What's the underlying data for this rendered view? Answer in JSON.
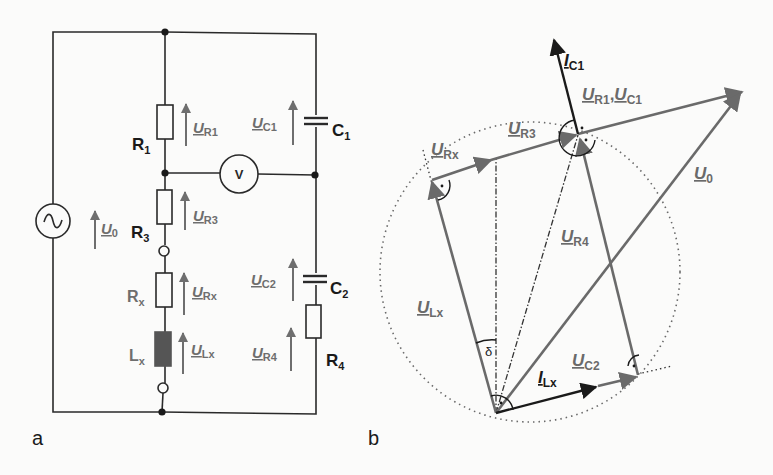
{
  "colors": {
    "background": "#fbfbfa",
    "wire": "#2a2a2a",
    "gray_label": "#6e6e6e",
    "black_label": "#1a1a1a",
    "inductor_fill": "#555555",
    "phasor_gray": "#6a6a6a",
    "phasor_black": "#1a1a1a"
  },
  "panel_a": {
    "label": "a",
    "components": {
      "R1": {
        "name": "R",
        "sub": "1"
      },
      "R3": {
        "name": "R",
        "sub": "3"
      },
      "Rx": {
        "name": "R",
        "sub": "x"
      },
      "Lx": {
        "name": "L",
        "sub": "x"
      },
      "C1": {
        "name": "C",
        "sub": "1"
      },
      "C2": {
        "name": "C",
        "sub": "2"
      },
      "R4": {
        "name": "R",
        "sub": "4"
      },
      "voltmeter": "V",
      "source": "~"
    },
    "voltages": {
      "U0": {
        "name": "U",
        "sub": "0"
      },
      "UR1": {
        "name": "U",
        "sub": "R1"
      },
      "UR3": {
        "name": "U",
        "sub": "R3"
      },
      "URx": {
        "name": "U",
        "sub": "Rx"
      },
      "ULx": {
        "name": "U",
        "sub": "Lx"
      },
      "UC1": {
        "name": "U",
        "sub": "C1"
      },
      "UC2": {
        "name": "U",
        "sub": "C2"
      },
      "UR4": {
        "name": "U",
        "sub": "R4"
      }
    }
  },
  "panel_b": {
    "label": "b",
    "phasors": {
      "IC1": {
        "name": "I",
        "sub": "C1"
      },
      "UR1_UC1": {
        "name1": "U",
        "sub1": "R1",
        "sep": ",",
        "name2": "U",
        "sub2": "C1"
      },
      "UR3": {
        "name": "U",
        "sub": "R3"
      },
      "URx": {
        "name": "U",
        "sub": "Rx"
      },
      "U0": {
        "name": "U",
        "sub": "0"
      },
      "UR4": {
        "name": "U",
        "sub": "R4"
      },
      "ULx": {
        "name": "U",
        "sub": "Lx"
      },
      "ILx": {
        "name": "I",
        "sub": "Lx"
      },
      "UC2": {
        "name": "U",
        "sub": "C2"
      }
    },
    "angle_label": "δ"
  }
}
